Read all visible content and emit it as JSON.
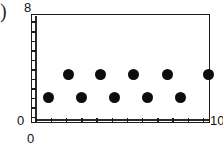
{
  "figure": {
    "caption_marker": ")",
    "axis_labels": {
      "y_max": "8",
      "y_min": "0",
      "x_min": "0",
      "x_max": "10"
    }
  },
  "chart_data": {
    "type": "scatter",
    "title": "",
    "subtitle": "",
    "xlabel": "",
    "ylabel": "",
    "xlim": [
      0,
      10
    ],
    "ylim": [
      0,
      8
    ],
    "grid": false,
    "legend": null,
    "x_tick_labels": [
      "0",
      "10"
    ],
    "y_tick_labels": [
      "0",
      "8"
    ],
    "x_ticks": [
      0.25,
      1.1,
      1.95,
      2.8,
      3.65,
      4.5,
      5.35,
      6.2,
      7.05,
      7.9,
      8.75,
      9.6
    ],
    "y_ticks": [
      0.45,
      1.15,
      1.85,
      2.55,
      3.25,
      3.95,
      4.65,
      5.35,
      6.05,
      6.75,
      7.45
    ],
    "marker": "filled-circle",
    "marker_color": "#0d0d0d",
    "marker_size_px": 11,
    "series": [
      {
        "name": "upper row",
        "x": [
          2.1,
          3.9,
          5.7,
          7.6,
          9.9
        ],
        "y": [
          3.55,
          3.55,
          3.55,
          3.55,
          3.55
        ]
      },
      {
        "name": "lower row",
        "x": [
          0.95,
          2.8,
          4.65,
          6.5,
          8.35
        ],
        "y": [
          1.85,
          1.85,
          1.85,
          1.85,
          1.85
        ]
      }
    ]
  }
}
